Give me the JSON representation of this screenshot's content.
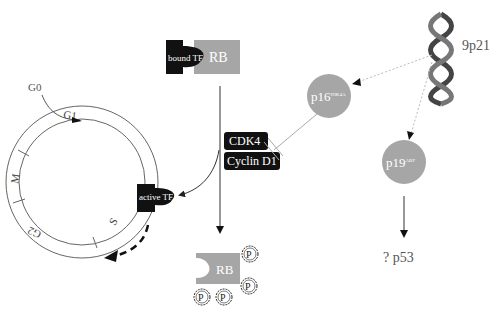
{
  "diagram": {
    "chromosome": {
      "label": "9p21"
    },
    "p16": {
      "main": "p16",
      "sup": "INK4A"
    },
    "p19": {
      "main": "p19",
      "sup": "ARF"
    },
    "p53": {
      "label": "? p53"
    },
    "bound_complex": {
      "tf_label": "bound TF",
      "rb_label": "RB"
    },
    "cdk4": {
      "label": "CDK4"
    },
    "cyclin": {
      "label": "Cyclin D1"
    },
    "active_tf": {
      "label": "active TF"
    },
    "phospho_rb": {
      "rb_label": "RB",
      "phosphate_label": "P"
    },
    "cell_cycle": {
      "g0": "G0",
      "g1": "G1",
      "s": "S",
      "g2": "G2",
      "m": "M"
    },
    "colors": {
      "grey_protein": "#a6a6a6",
      "black": "#111111",
      "line": "#555555",
      "dotted": "#bbbbbb"
    }
  }
}
